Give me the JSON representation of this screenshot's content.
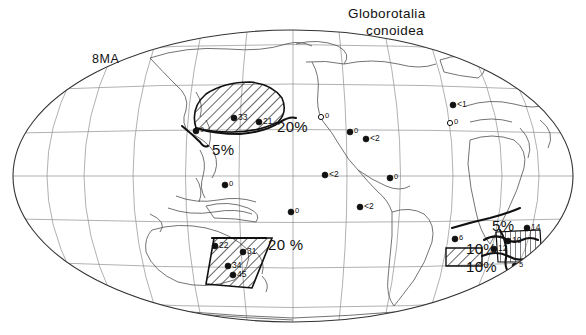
{
  "figure": {
    "taxon_line1": "Globorotalia",
    "taxon_line2": "conoidea",
    "age_label": "8MA",
    "caption": "",
    "ink_color": "#111111",
    "coast_color": "#5a5a5a",
    "graticule_color": "#8f8f8f",
    "background": "#ffffff"
  },
  "chart_data": {
    "type": "map",
    "title": "Globorotalia conoidea",
    "subtitle": "8MA",
    "projection": "mollweide",
    "xlabel": "",
    "ylabel": "",
    "value_units": "percent relative abundance",
    "grid": true,
    "legend_position": "none",
    "contour_levels": [
      5,
      10,
      20
    ],
    "contour_labels": [
      {
        "id": "np-20",
        "text": "20%",
        "x": 277,
        "y": 118,
        "level": 20,
        "region": "North Pacific"
      },
      {
        "id": "np-5",
        "text": "5%",
        "x": 212,
        "y": 141,
        "level": 5,
        "region": "North Pacific"
      },
      {
        "id": "tasman-20",
        "text": "20 %",
        "x": 268,
        "y": 236,
        "level": 20,
        "region": "Tasman Sea / New Zealand"
      },
      {
        "id": "satl-5",
        "text": "5%",
        "x": 492,
        "y": 217,
        "level": 5,
        "region": "South Atlantic"
      },
      {
        "id": "satl-10a",
        "text": "10%",
        "x": 466,
        "y": 240,
        "level": 10,
        "region": "South Atlantic"
      },
      {
        "id": "satl-10b",
        "text": "10%",
        "x": 466,
        "y": 258,
        "level": 10,
        "region": "Southern Ocean / Indian"
      }
    ],
    "hatched_regions": [
      {
        "id": "north-pacific-high",
        "label": "20%",
        "style": "diagonal-hatch",
        "centroid_x": 237,
        "centroid_y": 105
      },
      {
        "id": "tasman-high",
        "label": "20 %",
        "style": "diagonal-hatch",
        "centroid_x": 237,
        "centroid_y": 255
      },
      {
        "id": "south-atlantic-high",
        "label": "10%",
        "style": "vertical-hatch",
        "centroid_x": 520,
        "centroid_y": 243
      },
      {
        "id": "southern-ocean-high",
        "label": "10%",
        "style": "diagonal-hatch",
        "centroid_x": 455,
        "centroid_y": 253
      }
    ],
    "points": [
      {
        "value": "33",
        "x": 234,
        "y": 118,
        "marker": "filled"
      },
      {
        "value": "21",
        "x": 259,
        "y": 122,
        "marker": "filled"
      },
      {
        "value": "9",
        "x": 196,
        "y": 131,
        "marker": "filled"
      },
      {
        "value": "0",
        "x": 321,
        "y": 117,
        "marker": "open"
      },
      {
        "value": "0",
        "x": 350,
        "y": 132,
        "marker": "filled"
      },
      {
        "value": "<2",
        "x": 366,
        "y": 139,
        "marker": "filled"
      },
      {
        "value": "<1",
        "x": 453,
        "y": 105,
        "marker": "filled"
      },
      {
        "value": "0",
        "x": 450,
        "y": 123,
        "marker": "open"
      },
      {
        "value": "<2",
        "x": 325,
        "y": 175,
        "marker": "filled"
      },
      {
        "value": "<2",
        "x": 360,
        "y": 207,
        "marker": "filled"
      },
      {
        "value": "0",
        "x": 390,
        "y": 178,
        "marker": "filled"
      },
      {
        "value": "0",
        "x": 291,
        "y": 212,
        "marker": "filled"
      },
      {
        "value": "0",
        "x": 225,
        "y": 185,
        "marker": "filled"
      },
      {
        "value": "22",
        "x": 215,
        "y": 246,
        "marker": "filled"
      },
      {
        "value": "31",
        "x": 243,
        "y": 252,
        "marker": "filled"
      },
      {
        "value": "34",
        "x": 228,
        "y": 266,
        "marker": "filled"
      },
      {
        "value": "45",
        "x": 233,
        "y": 275,
        "marker": "filled"
      },
      {
        "value": "6",
        "x": 455,
        "y": 239,
        "marker": "filled"
      },
      {
        "value": "10",
        "x": 508,
        "y": 241,
        "marker": "filled"
      },
      {
        "value": "12",
        "x": 494,
        "y": 249,
        "marker": "filled"
      },
      {
        "value": "14",
        "x": 527,
        "y": 228,
        "marker": "filled"
      },
      {
        "value": "5",
        "x": 515,
        "y": 266,
        "marker": "filled"
      }
    ]
  }
}
